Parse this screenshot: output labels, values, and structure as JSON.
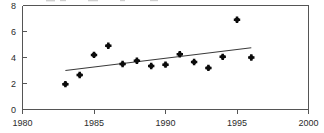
{
  "chart_data": {
    "type": "scatter",
    "title": "",
    "subtitle": "",
    "xlabel": "",
    "ylabel": "",
    "xlim": [
      1980,
      2000
    ],
    "ylim": [
      0,
      8
    ],
    "xticks": [
      1980,
      1985,
      1990,
      1995,
      2000
    ],
    "yticks": [
      0,
      2,
      4,
      6,
      8
    ],
    "xtick_labels": [
      "1980",
      "1985",
      "1990",
      "1995",
      "2000"
    ],
    "ytick_labels": [
      "0",
      "2",
      "4",
      "6",
      "8"
    ],
    "grid": false,
    "legend": false,
    "legend_position": "none",
    "marker": "diamond-plus",
    "x": [
      1983,
      1984,
      1985,
      1986,
      1987,
      1988,
      1989,
      1990,
      1991,
      1992,
      1993,
      1994,
      1995,
      1996
    ],
    "values": [
      1.95,
      2.65,
      4.2,
      4.9,
      3.5,
      3.75,
      3.35,
      3.45,
      4.25,
      3.65,
      3.2,
      4.05,
      6.9,
      4.0
    ],
    "series": [
      {
        "name": "observations",
        "type": "scatter",
        "x": [
          1983,
          1984,
          1985,
          1986,
          1987,
          1988,
          1989,
          1990,
          1991,
          1992,
          1993,
          1994,
          1995,
          1996
        ],
        "values": [
          1.95,
          2.65,
          4.2,
          4.9,
          3.5,
          3.75,
          3.35,
          3.45,
          4.25,
          3.65,
          3.2,
          4.05,
          6.9,
          4.0
        ]
      },
      {
        "name": "trend",
        "type": "line",
        "x": [
          1983,
          1996
        ],
        "values": [
          3.0,
          4.75
        ]
      }
    ],
    "annotations": []
  },
  "axes": {
    "x_axis_name": "x-axis",
    "y_axis_name": "y-axis"
  }
}
